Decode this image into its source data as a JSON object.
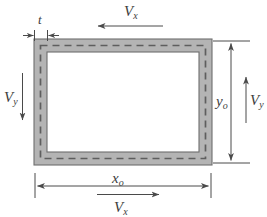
{
  "figure": {
    "stroke_color": "#4a4a4a",
    "band_fill": "#b4b4b4",
    "band_edge": "#6e6e6e",
    "dash_color": "#5e5e5e",
    "interior_fill": "#ffffff"
  },
  "labels": {
    "thickness": {
      "base": "t",
      "sub": ""
    },
    "shear_x_top": {
      "base": "V",
      "sub": "x"
    },
    "shear_x_bottom": {
      "base": "V",
      "sub": "x"
    },
    "shear_y_left": {
      "base": "V",
      "sub": "y"
    },
    "shear_y_right": {
      "base": "V",
      "sub": "y"
    },
    "dim_width": {
      "base": "x",
      "sub": "o"
    },
    "dim_height": {
      "base": "y",
      "sub": "o"
    }
  },
  "geometry": {
    "outer": {
      "x": 34,
      "y": 39,
      "width": 178,
      "height": 126
    },
    "inner": {
      "x": 47,
      "y": 52,
      "width": 152,
      "height": 100
    },
    "wall_thickness": 13
  },
  "annotations": {
    "thickness_leader": "inward arrows marking wall thickness t at top-left",
    "top_arrow_direction": "left",
    "bottom_arrow_direction": "right",
    "left_arrow_direction": "down",
    "right_arrow_direction": "up",
    "width_dimension": "double-headed arrow below figure",
    "height_dimension": "double-headed arrow right of figure"
  }
}
